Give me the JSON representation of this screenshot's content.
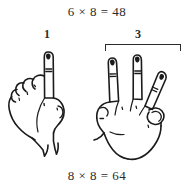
{
  "illustration": {
    "title_equation": "6 × 8 = 48",
    "bottom_equation": "8 × 8 = 64",
    "left_hand": {
      "label": "1",
      "name": "left-hand-one-finger",
      "extended_fingers": 1,
      "finger_marks": [
        "10"
      ]
    },
    "right_hand": {
      "label": "3",
      "name": "right-hand-three-fingers",
      "extended_fingers": 3,
      "finger_marks": [
        "10",
        "10",
        "10"
      ]
    },
    "brace": {
      "name": "grouping-brace",
      "spans": "right-hand"
    },
    "colors": {
      "ink": "#1b1b1b",
      "text": "#2b2b2b",
      "background": "#ffffff"
    }
  }
}
